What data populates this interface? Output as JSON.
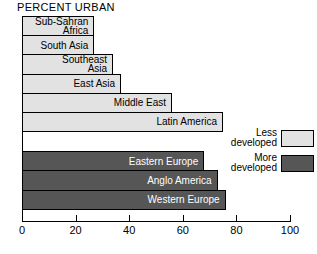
{
  "chart_data": {
    "type": "bar",
    "orientation": "horizontal",
    "title": "PERCENT URBAN",
    "xlabel": "",
    "ylabel": "",
    "xlim": [
      0,
      100
    ],
    "xticks": [
      0,
      20,
      40,
      60,
      80,
      100
    ],
    "xtick_labels": [
      "0",
      "20",
      "40",
      "60",
      "80",
      "100"
    ],
    "grid": false,
    "legend_position": "right",
    "groups": [
      {
        "name": "Less developed",
        "color": "#e2e2e2",
        "categories": [
          "Sub-Sahran\nAfrica",
          "South Asia",
          "Southeast\nAsia",
          "East Asia",
          "Middle East",
          "Latin America"
        ],
        "values": [
          27,
          27,
          34,
          37,
          56,
          75
        ]
      },
      {
        "name": "More developed",
        "color": "#565656",
        "categories": [
          "Eastern Europe",
          "Anglo America",
          "Western Europe"
        ],
        "values": [
          68,
          73,
          76
        ]
      }
    ],
    "categories": [
      "Sub-Sahran Africa",
      "South Asia",
      "Southeast Asia",
      "East Asia",
      "Middle East",
      "Latin America",
      "Eastern Europe",
      "Anglo America",
      "Western Europe"
    ],
    "values": [
      27,
      27,
      34,
      37,
      56,
      75,
      68,
      73,
      76
    ]
  },
  "bars": [
    {
      "label": "Sub-Sahran\nAfrica",
      "value": 27,
      "group": "less"
    },
    {
      "label": "South Asia",
      "value": 27,
      "group": "less"
    },
    {
      "label": "Southeast\nAsia",
      "value": 34,
      "group": "less"
    },
    {
      "label": "East Asia",
      "value": 37,
      "group": "less"
    },
    {
      "label": "Middle East",
      "value": 56,
      "group": "less"
    },
    {
      "label": "Latin America",
      "value": 75,
      "group": "less"
    },
    {
      "label": "Eastern Europe",
      "value": 68,
      "group": "more"
    },
    {
      "label": "Anglo America",
      "value": 73,
      "group": "more"
    },
    {
      "label": "Western Europe",
      "value": 76,
      "group": "more"
    }
  ],
  "legend": {
    "items": [
      {
        "label": "Less\ndeveloped",
        "swatch": "less"
      },
      {
        "label": "More\ndeveloped",
        "swatch": "more"
      }
    ]
  },
  "axis": {
    "ticks": [
      {
        "label": "0",
        "value": 0
      },
      {
        "label": "20",
        "value": 20
      },
      {
        "label": "40",
        "value": 40
      },
      {
        "label": "60",
        "value": 60
      },
      {
        "label": "80",
        "value": 80
      },
      {
        "label": "100",
        "value": 100
      }
    ]
  },
  "colors": {
    "less_developed": "#e2e2e2",
    "more_developed": "#565656",
    "outline": "#000000",
    "background": "#ffffff"
  }
}
